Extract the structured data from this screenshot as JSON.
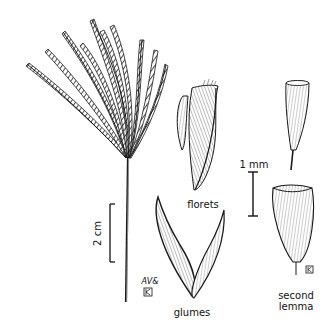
{
  "figure": {
    "labels": {
      "florets": "florets",
      "glumes": "glumes",
      "second_lemma_line1": "second",
      "second_lemma_line2": "lemma"
    },
    "scale_bars": {
      "large": "2 cm",
      "small": "1 mm"
    },
    "signatures": {
      "artist": "AV&",
      "monogram": "K"
    },
    "colors": {
      "ink": "#1a1a1a",
      "background": "#ffffff"
    }
  }
}
